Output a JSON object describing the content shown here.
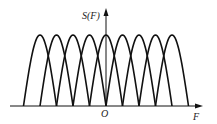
{
  "figure": {
    "y_axis_label": "S(F)",
    "x_axis_label": "F",
    "origin_label": "O",
    "stroke_color": "#111111",
    "background": "#ffffff"
  },
  "geometry": {
    "baseline_y": 106,
    "x_axis_start": 10,
    "x_axis_end": 203,
    "y_axis_x": 106,
    "y_axis_top": 8,
    "peak_y": 35,
    "lobe_half_width": 16.5,
    "lobe_centers": [
      40,
      56.5,
      73,
      89.5,
      106,
      122.5,
      139,
      155.5,
      172
    ]
  }
}
